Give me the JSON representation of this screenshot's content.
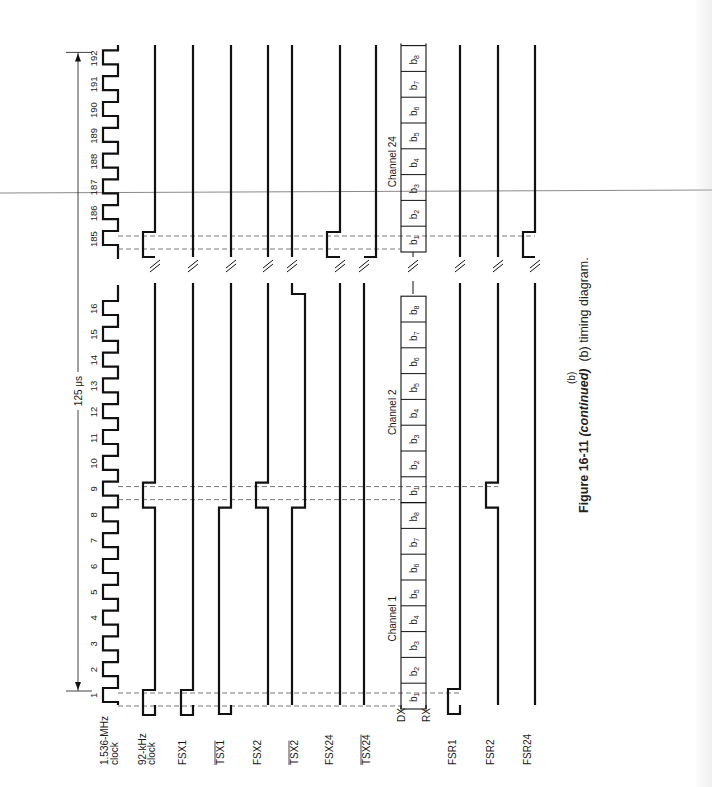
{
  "figure": {
    "number": "Figure 16-11",
    "continued": "(continued)",
    "description": "(b) timing diagram.",
    "sublabel": "(b)"
  },
  "period": {
    "label": "125 μs",
    "start_tick": 1,
    "end_tick": 192
  },
  "clock_ticks": [
    "1",
    "2",
    "3",
    "4",
    "5",
    "6",
    "7",
    "8",
    "9",
    "10",
    "11",
    "12",
    "13",
    "14",
    "15",
    "16",
    "185",
    "186",
    "187",
    "188",
    "189",
    "190",
    "191",
    "192"
  ],
  "signals": [
    {
      "id": "clk1536",
      "label_line1": "1.536-MHz",
      "label_line2": "clock",
      "overbar": false
    },
    {
      "id": "clk92",
      "label_line1": "92-kHz",
      "label_line2": "clock",
      "overbar": false
    },
    {
      "id": "fsx1",
      "label_line1": "FSX1",
      "overbar": false
    },
    {
      "id": "tsx1",
      "label_line1": "TSX1",
      "overbar": true
    },
    {
      "id": "fsx2",
      "label_line1": "FSX2",
      "overbar": false
    },
    {
      "id": "tsx2",
      "label_line1": "TSX2",
      "overbar": true
    },
    {
      "id": "fsx24",
      "label_line1": "FSX24",
      "overbar": false
    },
    {
      "id": "tsx24",
      "label_line1": "TSX24",
      "overbar": true
    },
    {
      "id": "dx",
      "label_line1": "DX",
      "overbar": false
    },
    {
      "id": "rx",
      "label_line1": "RX",
      "overbar": false
    },
    {
      "id": "fsr1",
      "label_line1": "FSR1",
      "overbar": false
    },
    {
      "id": "fsr2",
      "label_line1": "FSR2",
      "overbar": false
    },
    {
      "id": "fsr24",
      "label_line1": "FSR24",
      "overbar": false
    }
  ],
  "channels": [
    {
      "label": "Channel 1",
      "bits": [
        "b1",
        "b2",
        "b3",
        "b4",
        "b5",
        "b6",
        "b7",
        "b8"
      ]
    },
    {
      "label": "Channel 2",
      "bits": [
        "b1",
        "b2",
        "b3",
        "b4",
        "b5",
        "b6",
        "b7",
        "b8"
      ]
    },
    {
      "label": "Channel 24",
      "bits": [
        "b1",
        "b2",
        "b3",
        "b4",
        "b5",
        "b6",
        "b7",
        "b8"
      ]
    }
  ],
  "colors": {
    "trace": "#111111",
    "dashed": "#555555",
    "artifact": "#8a8a8a"
  }
}
